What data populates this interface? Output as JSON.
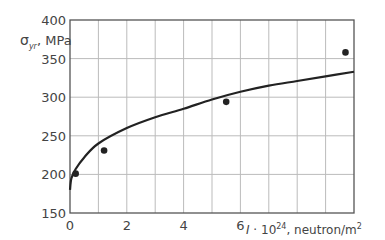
{
  "chart_data": {
    "type": "scatter",
    "title": "",
    "xlabel": "I · 10^24, neutron/m^2",
    "xlabel_parts": {
      "var": "I",
      "dot": " · 10",
      "exp": "24",
      "unit": ", neutron/m",
      "unit_exp": "2"
    },
    "ylabel": "σyr, MPa",
    "ylabel_parts": {
      "sym": "σ",
      "sub": "yr",
      "unit": ", MPa"
    },
    "xlim": [
      0,
      10
    ],
    "ylim": [
      150,
      400
    ],
    "x_ticks": [
      0,
      2,
      4,
      6
    ],
    "x_tick_labels": [
      "0",
      "2",
      "4",
      "6"
    ],
    "y_ticks": [
      150,
      200,
      250,
      300,
      350,
      400
    ],
    "y_tick_labels": [
      "150",
      "200",
      "250",
      "300",
      "350",
      "400"
    ],
    "grid": true,
    "grid_x_step": 1,
    "grid_y_step": 50,
    "legend": null,
    "series": [
      {
        "name": "measured",
        "type": "scatter",
        "x": [
          0.2,
          1.2,
          5.5,
          9.7
        ],
        "y": [
          201,
          231,
          294,
          358
        ]
      },
      {
        "name": "fit curve",
        "type": "line",
        "x": [
          0,
          0.05,
          0.2,
          0.5,
          1.0,
          2.0,
          3.0,
          4.0,
          5.0,
          6.0,
          7.0,
          8.0,
          9.0,
          10.0
        ],
        "y": [
          180,
          195,
          207,
          222,
          240,
          260,
          274,
          285,
          297,
          307,
          315,
          321,
          327,
          333
        ]
      }
    ]
  },
  "colors": {
    "axis": "#555555",
    "grid": "#bbbbbb",
    "curve": "#222222",
    "points": "#222222"
  }
}
